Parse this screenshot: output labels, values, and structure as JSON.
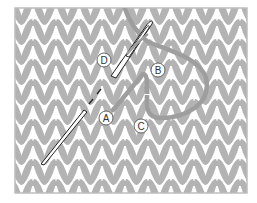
{
  "figure": {
    "width": 257,
    "height": 203
  },
  "frame": {
    "x": 15,
    "y": 8,
    "width": 232,
    "height": 185,
    "stroke": "#bdbdbd"
  },
  "colors": {
    "background": "#ffffff",
    "stitch": "#b3b3b3",
    "square": "#b3b3b3",
    "yarn": "#9e9e9e",
    "needle_outline": "#222222",
    "needle_fill": "#ffffff",
    "label_stroke": "#555555",
    "label_fill": "#ffffff"
  },
  "knit_grid": {
    "col_width": 23,
    "row_height": 20,
    "origin_x": 10,
    "origin_y": -2
  },
  "labels": [
    {
      "id": "A",
      "text": "A",
      "cx": 106,
      "cy": 118
    },
    {
      "id": "B",
      "text": "B",
      "cx": 158,
      "cy": 70
    },
    {
      "id": "C",
      "text": "C",
      "cx": 141,
      "cy": 126
    },
    {
      "id": "D",
      "text": "D",
      "cx": 104,
      "cy": 60
    }
  ],
  "icons": {
    "needle": "sewing-needle-icon",
    "yarn": "yarn-strand-icon"
  }
}
